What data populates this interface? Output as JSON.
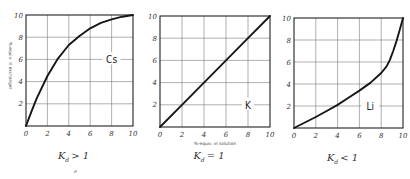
{
  "chart_data": [
    {
      "type": "line",
      "title": "",
      "series_label": "Cs",
      "caption": {
        "k": "K",
        "sub": "d",
        "rel": "> 1"
      },
      "xlabel": "",
      "ylabel": "%-equiv. in exchanger",
      "xlim": [
        0,
        10
      ],
      "ylim": [
        0,
        10
      ],
      "xticks": [
        "0",
        "2",
        "4",
        "6",
        "8",
        "10"
      ],
      "yticks": [
        "2",
        "4",
        "6",
        "8",
        "10"
      ],
      "grid": true,
      "series": [
        {
          "name": "Cs",
          "x": [
            0,
            0.5,
            1,
            2,
            3,
            4,
            5,
            6,
            7,
            8,
            9,
            10
          ],
          "y": [
            0,
            1.3,
            2.5,
            4.5,
            6.1,
            7.3,
            8.1,
            8.8,
            9.3,
            9.6,
            9.85,
            10
          ]
        }
      ],
      "footnote": "e"
    },
    {
      "type": "line",
      "title": "",
      "series_label": "K",
      "caption": {
        "k": "K",
        "sub": "d",
        "rel": "= 1"
      },
      "xlabel": "%-equiv. in solution",
      "ylabel": "",
      "xlim": [
        0,
        10
      ],
      "ylim": [
        0,
        10
      ],
      "xticks": [
        "0",
        "2",
        "4",
        "6",
        "8",
        "10"
      ],
      "yticks": [
        "2",
        "4",
        "6",
        "8",
        "10"
      ],
      "grid": true,
      "series": [
        {
          "name": "K",
          "x": [
            0,
            2,
            4,
            6,
            8,
            10
          ],
          "y": [
            0,
            2,
            4,
            6,
            8,
            10
          ]
        }
      ]
    },
    {
      "type": "line",
      "title": "",
      "series_label": "Li",
      "caption": {
        "k": "K",
        "sub": "d",
        "rel": "< 1"
      },
      "xlabel": "",
      "ylabel": "",
      "xlim": [
        0,
        10
      ],
      "ylim": [
        0,
        10
      ],
      "xticks": [
        "0",
        "2",
        "4",
        "6",
        "8",
        "10"
      ],
      "yticks": [
        "2",
        "4",
        "6",
        "8",
        "10"
      ],
      "grid": true,
      "series": [
        {
          "name": "Li",
          "x": [
            0,
            1,
            2,
            3,
            4,
            5,
            6,
            7,
            8,
            8.5,
            8.8,
            9.1,
            9.4,
            9.7,
            10
          ],
          "y": [
            0,
            0.5,
            1.0,
            1.55,
            2.1,
            2.75,
            3.4,
            4.1,
            5.0,
            5.6,
            6.2,
            7.0,
            7.9,
            8.9,
            10
          ]
        }
      ]
    }
  ],
  "layout": {
    "plots": [
      {
        "left": 26,
        "top": 15,
        "right": 133,
        "bottom": 126,
        "label_x": 8,
        "label_y": 6
      },
      {
        "left": 160,
        "top": 16,
        "right": 270,
        "bottom": 127,
        "label_x": 8,
        "label_y": 2
      },
      {
        "left": 294,
        "top": 18,
        "right": 403,
        "bottom": 128,
        "label_x": 7,
        "label_y": 2
      }
    ]
  }
}
